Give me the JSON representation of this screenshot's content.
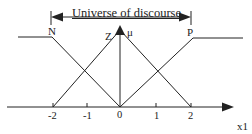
{
  "title": "Universe of discourse",
  "sets": [
    {
      "label": "N",
      "shape": "left-shoulder",
      "points": [
        [
          -3.0,
          1
        ],
        [
          -2,
          1
        ],
        [
          0,
          0
        ]
      ]
    },
    {
      "label": "Z",
      "shape": "triangle",
      "points": [
        [
          -2,
          0
        ],
        [
          0,
          1
        ],
        [
          2,
          0
        ]
      ]
    },
    {
      "label": "P",
      "shape": "right-shoulder",
      "points": [
        [
          0,
          0
        ],
        [
          2,
          1
        ],
        [
          3.0,
          1
        ]
      ]
    }
  ],
  "y_axis_label": "μ",
  "x_axis_label": "x1",
  "x_ticks": [
    "-2",
    "-1",
    "0",
    "1",
    "2"
  ],
  "colors": {
    "line": "#222222",
    "background": "#ffffff"
  }
}
